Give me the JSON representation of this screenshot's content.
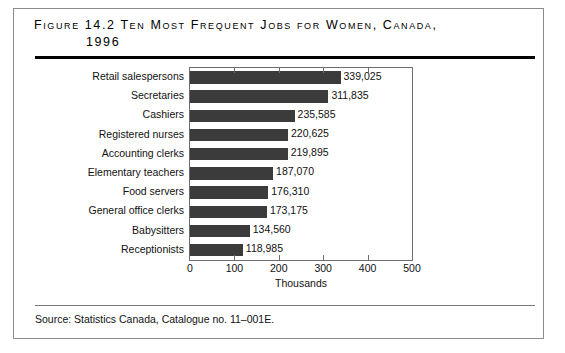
{
  "figure": {
    "title_line1": "Figure 14.2 Ten Most Frequent Jobs for Women, Canada,",
    "title_line2": "1996",
    "source": "Source:  Statistics Canada, Catalogue no. 11–001E."
  },
  "chart_data": {
    "type": "bar",
    "orientation": "horizontal",
    "title": "Figure 14.2 Ten Most Frequent Jobs for Women, Canada, 1996",
    "xlabel": "Thousands",
    "ylabel": "",
    "xlim": [
      0,
      500
    ],
    "xticks": [
      0,
      100,
      200,
      300,
      400,
      500
    ],
    "xtick_labels": [
      "0",
      "100",
      "200",
      "300",
      "400",
      "500"
    ],
    "grid": false,
    "legend": false,
    "units": "thousands",
    "bar_color": "#3b3b3b",
    "categories": [
      "Retail salespersons",
      "Secretaries",
      "Cashiers",
      "Registered nurses",
      "Accounting clerks",
      "Elementary teachers",
      "Food servers",
      "General office clerks",
      "Babysitters",
      "Receptionists"
    ],
    "values": [
      339.025,
      311.835,
      235.585,
      220.625,
      219.895,
      187.07,
      176.31,
      173.175,
      134.56,
      118.985
    ],
    "data_labels": [
      "339,025",
      "311,835",
      "235,585",
      "220,625",
      "219,895",
      "187,070",
      "176,310",
      "173,175",
      "134,560",
      "118,985"
    ]
  }
}
